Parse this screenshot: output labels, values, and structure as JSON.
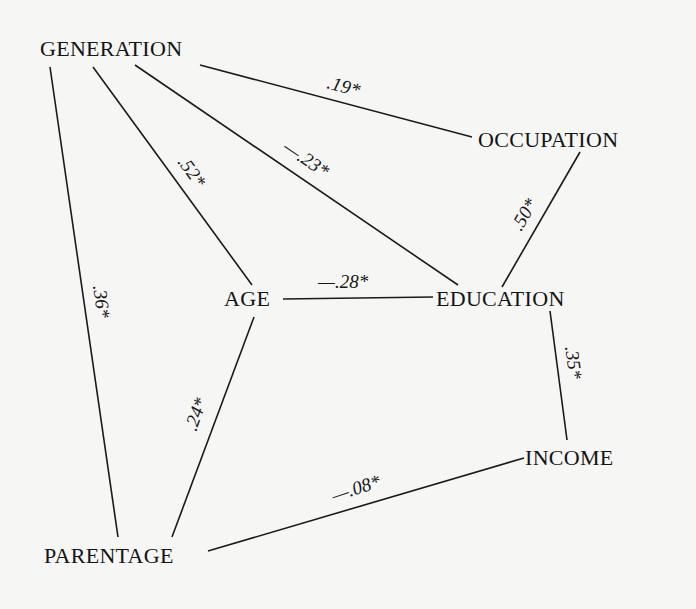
{
  "diagram": {
    "type": "path-diagram",
    "background": "#f6f6f4",
    "line_color": "#1a1a1a",
    "nodes": [
      {
        "id": "generation",
        "label": "GENERATION",
        "x": 40,
        "y": 56
      },
      {
        "id": "occupation",
        "label": "OCCUPATION",
        "x": 478,
        "y": 147
      },
      {
        "id": "age",
        "label": "AGE",
        "x": 224,
        "y": 306
      },
      {
        "id": "education",
        "label": "EDUCATION",
        "x": 436,
        "y": 306
      },
      {
        "id": "income",
        "label": "INCOME",
        "x": 525,
        "y": 465
      },
      {
        "id": "parentage",
        "label": "PARENTAGE",
        "x": 44,
        "y": 563
      }
    ],
    "edges": [
      {
        "from": "generation",
        "to": "occupation",
        "coefficient": ".19*",
        "x1": 200,
        "y1": 65,
        "x2": 472,
        "y2": 137,
        "lx": 326,
        "ly": 88,
        "rot": 15
      },
      {
        "from": "generation",
        "to": "age",
        "coefficient": ".52*",
        "x1": 93,
        "y1": 67,
        "x2": 252,
        "y2": 285,
        "lx": 177,
        "ly": 162,
        "rot": 54
      },
      {
        "from": "generation",
        "to": "education",
        "coefficient": "—.23*",
        "x1": 135,
        "y1": 65,
        "x2": 458,
        "y2": 285,
        "lx": 282,
        "ly": 150,
        "rot": 34
      },
      {
        "from": "generation",
        "to": "parentage",
        "coefficient": ".36*",
        "x1": 50,
        "y1": 67,
        "x2": 118,
        "y2": 537,
        "lx": 93,
        "ly": 286,
        "rot": 82
      },
      {
        "from": "occupation",
        "to": "education",
        "coefficient": ".50*",
        "x1": 580,
        "y1": 152,
        "x2": 502,
        "y2": 287,
        "lx": 521,
        "ly": 232,
        "rot": -60
      },
      {
        "from": "age",
        "to": "education",
        "coefficient": "—.28*",
        "x1": 283,
        "y1": 299,
        "x2": 433,
        "y2": 297,
        "lx": 318,
        "ly": 288,
        "rot": 0
      },
      {
        "from": "age",
        "to": "parentage",
        "coefficient": ".24*",
        "x1": 254,
        "y1": 317,
        "x2": 172,
        "y2": 537,
        "lx": 196,
        "ly": 432,
        "rot": -70
      },
      {
        "from": "education",
        "to": "income",
        "coefficient": ".35*",
        "x1": 550,
        "y1": 311,
        "x2": 567,
        "y2": 440,
        "lx": 565,
        "ly": 347,
        "rot": 82
      },
      {
        "from": "income",
        "to": "parentage",
        "coefficient": "—.08*",
        "x1": 524,
        "y1": 458,
        "x2": 208,
        "y2": 551,
        "lx": 334,
        "ly": 502,
        "rot": -18
      }
    ]
  }
}
